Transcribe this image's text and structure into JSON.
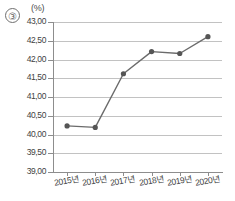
{
  "item_number": "③",
  "chart_data": {
    "type": "line",
    "title": "",
    "xlabel": "",
    "ylabel": "",
    "unit_label": "(%)",
    "categories": [
      "2015년",
      "2016년",
      "2017년",
      "2018년",
      "2019년",
      "2020년"
    ],
    "values": [
      40.23,
      40.19,
      41.62,
      42.21,
      42.16,
      42.61
    ],
    "series": [
      {
        "name": "",
        "values": [
          40.23,
          40.19,
          41.62,
          42.21,
          42.16,
          42.61
        ]
      }
    ],
    "ylim": [
      39.0,
      43.0
    ],
    "ytick_labels": [
      "43,00",
      "42,50",
      "42,00",
      "41,50",
      "41,00",
      "40,50",
      "40,00",
      "39,50",
      "39,00"
    ],
    "ytick_values": [
      43.0,
      42.5,
      42.0,
      41.5,
      41.0,
      40.5,
      40.0,
      39.5,
      39.0
    ],
    "grid": true,
    "legend": "none",
    "marker": "circle",
    "line_color": "#6b6b6b",
    "marker_color": "#555555",
    "grid_color": "#c2c2c2"
  }
}
